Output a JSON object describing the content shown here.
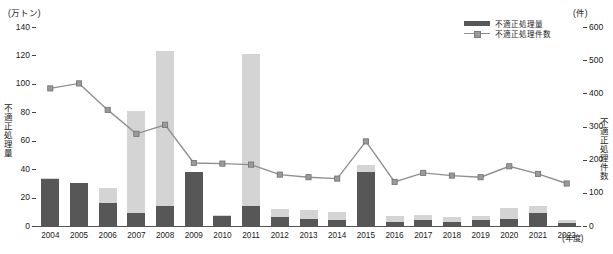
{
  "chart_data": {
    "type": "bar",
    "title": "",
    "xlabel": "年度",
    "categories": [
      "2004",
      "2005",
      "2006",
      "2007",
      "2008",
      "2009",
      "2010",
      "2011",
      "2012",
      "2013",
      "2014",
      "2015",
      "2016",
      "2017",
      "2018",
      "2019",
      "2020",
      "2021",
      "2022"
    ],
    "left_axis": {
      "unit": "(万トン)",
      "label": "不適正処理量",
      "ylim": [
        0,
        140
      ],
      "ticks": [
        0,
        20,
        40,
        60,
        80,
        100,
        120,
        140
      ],
      "tick_labels": [
        "0",
        "20",
        "40",
        "60",
        "80",
        "100",
        "120",
        "140"
      ]
    },
    "right_axis": {
      "unit": "(件)",
      "label": "不適正処理件数",
      "ylim": [
        0,
        600
      ],
      "ticks": [
        0,
        100,
        200,
        300,
        400,
        500,
        600
      ],
      "tick_labels": [
        "0",
        "100",
        "200",
        "300",
        "400",
        "500",
        "600"
      ]
    },
    "grid": false,
    "legend_position": "top-right",
    "series": [
      {
        "name": "不適正処理量",
        "type": "bar",
        "axis": "left",
        "color": "#575757",
        "values": [
          33,
          30,
          16,
          9,
          14,
          38,
          7,
          14,
          6,
          5,
          4,
          38,
          3,
          4,
          3,
          4,
          5,
          9,
          2
        ]
      },
      {
        "name": "不適正処理量（上積み）",
        "type": "bar",
        "axis": "left",
        "color": "#d4d4d4",
        "values": [
          1,
          0,
          11,
          72,
          109,
          0,
          1,
          107,
          6,
          6,
          6,
          5,
          4,
          4,
          3,
          3,
          8,
          5,
          2
        ]
      },
      {
        "name": "不適正処理件数",
        "type": "line",
        "axis": "right",
        "color": "#8f8f8f",
        "values": [
          415,
          430,
          350,
          278,
          305,
          190,
          188,
          185,
          155,
          147,
          143,
          255,
          133,
          160,
          152,
          147,
          180,
          157,
          128
        ]
      }
    ]
  },
  "legend": {
    "items": [
      {
        "label": "不適正処理量",
        "marker": "bar"
      },
      {
        "label": "不適正処理件数",
        "marker": "line"
      }
    ]
  }
}
